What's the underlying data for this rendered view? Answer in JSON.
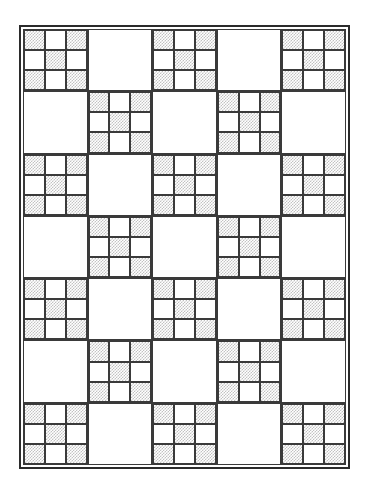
{
  "diagram": {
    "type": "quilt-layout-diagram",
    "title": "Nine-Patch Alternating Quilt Layout",
    "colors": {
      "outline": "#3a3a3a",
      "border_frame": "#2b2b2b",
      "shaded_fabric": "#c2c2c2",
      "light_fabric": "#ffffff",
      "page_background": "#ffffff"
    },
    "grid": {
      "columns": 5,
      "rows": 7,
      "total_blocks": 35,
      "block_types": [
        "ninepatch",
        "plain"
      ],
      "arrangement": "checkerboard-alternating"
    },
    "ninepatch": {
      "columns": 3,
      "rows": 3,
      "patch_count": 9,
      "shaded_patch_count": 5,
      "light_patch_count": 4,
      "patches": [
        "shaded",
        "light",
        "shaded",
        "light",
        "shaded",
        "light",
        "shaded",
        "light",
        "shaded"
      ]
    },
    "layout": [
      [
        "ninepatch",
        "plain",
        "ninepatch",
        "plain",
        "ninepatch"
      ],
      [
        "plain",
        "ninepatch",
        "plain",
        "ninepatch",
        "plain"
      ],
      [
        "ninepatch",
        "plain",
        "ninepatch",
        "plain",
        "ninepatch"
      ],
      [
        "plain",
        "ninepatch",
        "plain",
        "ninepatch",
        "plain"
      ],
      [
        "ninepatch",
        "plain",
        "ninepatch",
        "plain",
        "ninepatch"
      ],
      [
        "plain",
        "ninepatch",
        "plain",
        "ninepatch",
        "plain"
      ],
      [
        "ninepatch",
        "plain",
        "ninepatch",
        "plain",
        "ninepatch"
      ]
    ]
  }
}
